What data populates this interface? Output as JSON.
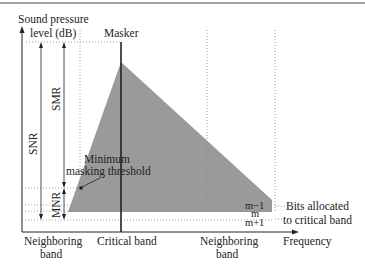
{
  "diagram": {
    "y_axis_label_line1": "Sound pressure",
    "y_axis_label_line2": "level (dB)",
    "masker_label": "Masker",
    "snr_label": "SNR",
    "smr_label": "SMR",
    "mnr_label": "MNR",
    "threshold_label_line1": "Minimum",
    "threshold_label_line2": "masking threshold",
    "level_labels": [
      "m−1",
      "m",
      "m+1"
    ],
    "bits_label_line1": "Bits allocated",
    "bits_label_line2": "to critical band",
    "x_axis_label": "Frequency",
    "bands": [
      {
        "line1": "Neighboring",
        "line2": "band"
      },
      {
        "line1": "Critical band",
        "line2": ""
      },
      {
        "line1": "Neighboring",
        "line2": "band"
      }
    ],
    "colors": {
      "masking_area": "#9a9a9a",
      "lines": "#222222",
      "dotted": "#888888",
      "top_border": "#a0a0a0"
    }
  }
}
